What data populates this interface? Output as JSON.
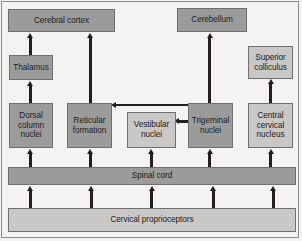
{
  "diagram": {
    "background_color": "#f4f3f1",
    "node_fill_dark": "#9b9b9b",
    "node_fill_light": "#c9c8c6",
    "arrow_color": "#231f20",
    "border_color": "#6f6f6f",
    "nodes": [
      {
        "id": "cerebral-cortex",
        "label": "Cerebral cortex",
        "shade": "dark"
      },
      {
        "id": "cerebellum",
        "label": "Cerebellum",
        "shade": "dark"
      },
      {
        "id": "thalamus",
        "label": "Thalamus",
        "shade": "dark"
      },
      {
        "id": "superior-colliculus",
        "label": "Superior colliculus",
        "shade": "light"
      },
      {
        "id": "dorsal-column-nuclei",
        "label": "Dorsal column nuclei",
        "shade": "dark"
      },
      {
        "id": "reticular-formation",
        "label": "Reticular formation",
        "shade": "dark"
      },
      {
        "id": "vestibular-nuclei",
        "label": "Vestibular nuclei",
        "shade": "light"
      },
      {
        "id": "trigeminal-nuclei",
        "label": "Trigeminal nuclei",
        "shade": "dark"
      },
      {
        "id": "central-cervical-nucleus",
        "label": "Central cervical nucleus",
        "shade": "light"
      },
      {
        "id": "spinal-cord",
        "label": "Spinal cord",
        "shade": "dark"
      },
      {
        "id": "cervical-proprioceptors",
        "label": "Cervical proprioceptors",
        "shade": "light"
      }
    ],
    "node_labels": {
      "cerebral_cortex": "Cerebral cortex",
      "cerebellum": "Cerebellum",
      "thalamus": "Thalamus",
      "superior_colliculus_line1": "Superior",
      "superior_colliculus_line2": "colliculus",
      "dorsal_column_nuclei_line1": "Dorsal",
      "dorsal_column_nuclei_line2": "column",
      "dorsal_column_nuclei_line3": "nuclei",
      "reticular_formation_line1": "Reticular",
      "reticular_formation_line2": "formation",
      "vestibular_nuclei_line1": "Vestibular",
      "vestibular_nuclei_line2": "nuclei",
      "trigeminal_nuclei_line1": "Trigeminal",
      "trigeminal_nuclei_line2": "nuclei",
      "central_cervical_nucleus_line1": "Central",
      "central_cervical_nucleus_line2": "cervical",
      "central_cervical_nucleus_line3": "nucleus",
      "spinal_cord": "Spinal cord",
      "cervical_proprioceptors": "Cervical proprioceptors"
    },
    "connections": [
      {
        "from": "cervical-proprioceptors",
        "to": "spinal-cord",
        "direction": "up"
      },
      {
        "from": "cervical-proprioceptors",
        "to": "spinal-cord",
        "direction": "up"
      },
      {
        "from": "cervical-proprioceptors",
        "to": "spinal-cord",
        "direction": "up"
      },
      {
        "from": "cervical-proprioceptors",
        "to": "spinal-cord",
        "direction": "up"
      },
      {
        "from": "cervical-proprioceptors",
        "to": "spinal-cord",
        "direction": "up"
      },
      {
        "from": "spinal-cord",
        "to": "dorsal-column-nuclei",
        "direction": "up"
      },
      {
        "from": "spinal-cord",
        "to": "reticular-formation",
        "direction": "up"
      },
      {
        "from": "spinal-cord",
        "to": "vestibular-nuclei",
        "direction": "up"
      },
      {
        "from": "spinal-cord",
        "to": "trigeminal-nuclei",
        "direction": "up"
      },
      {
        "from": "spinal-cord",
        "to": "central-cervical-nucleus",
        "direction": "up"
      },
      {
        "from": "dorsal-column-nuclei",
        "to": "thalamus",
        "direction": "up"
      },
      {
        "from": "thalamus",
        "to": "cerebral-cortex",
        "direction": "up"
      },
      {
        "from": "reticular-formation",
        "to": "cerebral-cortex",
        "direction": "up"
      },
      {
        "from": "trigeminal-nuclei",
        "to": "cerebellum",
        "direction": "up"
      },
      {
        "from": "central-cervical-nucleus",
        "to": "superior-colliculus",
        "direction": "up"
      },
      {
        "from": "trigeminal-nuclei",
        "to": "reticular-formation",
        "direction": "left"
      },
      {
        "from": "trigeminal-nuclei",
        "to": "vestibular-nuclei",
        "direction": "left"
      }
    ]
  }
}
